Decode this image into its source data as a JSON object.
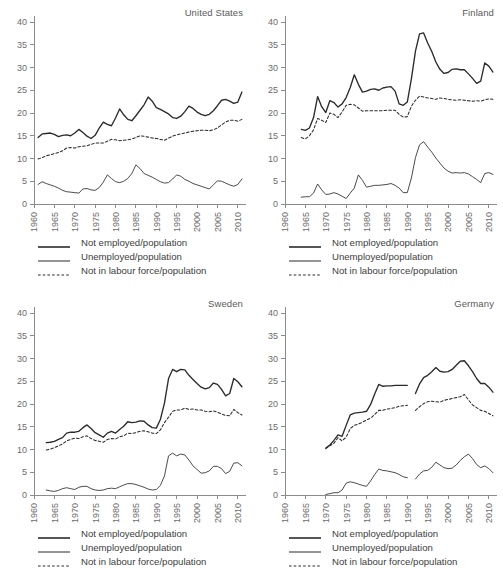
{
  "figure": {
    "width": 503,
    "height": 581,
    "background": "#ffffff",
    "line_color": "#2b2b2b",
    "axis_color": "#8c8c8c",
    "text_color": "#5a5a5a"
  },
  "legend": {
    "items": [
      {
        "label": "Not employed/population",
        "style": "solid",
        "width": "thick",
        "key": "legend-key-not-employed"
      },
      {
        "label": "Unemployed/population",
        "style": "solid",
        "width": "thin",
        "key": "legend-key-unemployed"
      },
      {
        "label": "Not in labour force/population",
        "style": "dashed",
        "width": "thin",
        "key": "legend-key-not-in-labour-force"
      }
    ]
  },
  "axes": {
    "x_ticks": [
      "1960",
      "1965",
      "1970",
      "1975",
      "1980",
      "1985",
      "1990",
      "1995",
      "2000",
      "2005",
      "2010"
    ],
    "x_tick_values": [
      1960,
      1965,
      1970,
      1975,
      1980,
      1985,
      1990,
      1995,
      2000,
      2005,
      2010
    ],
    "y_ticks": [
      "0",
      "5",
      "10",
      "15",
      "20",
      "25",
      "30",
      "35",
      "40"
    ],
    "y_tick_values": [
      0,
      5,
      10,
      15,
      20,
      25,
      30,
      35,
      40
    ],
    "xlim": [
      1960,
      2012
    ],
    "ylim": [
      0,
      40
    ],
    "grid": false,
    "xlabel": "",
    "ylabel": ""
  },
  "chart_data": [
    {
      "type": "line",
      "title": "United States",
      "panel": "top-left",
      "xlabel": "",
      "ylabel": "",
      "xlim": [
        1960,
        2012
      ],
      "ylim": [
        0,
        40
      ],
      "grid": false,
      "legend_position": "below",
      "x": [
        1961,
        1962,
        1963,
        1964,
        1965,
        1966,
        1967,
        1968,
        1969,
        1970,
        1971,
        1972,
        1973,
        1974,
        1975,
        1976,
        1977,
        1978,
        1979,
        1980,
        1981,
        1982,
        1983,
        1984,
        1985,
        1986,
        1987,
        1988,
        1989,
        1990,
        1991,
        1992,
        1993,
        1994,
        1995,
        1996,
        1997,
        1998,
        1999,
        2000,
        2001,
        2002,
        2003,
        2004,
        2005,
        2006,
        2007,
        2008,
        2009,
        2010,
        2011
      ],
      "series": [
        {
          "name": "Not employed/population",
          "style": "solid",
          "width": "thick",
          "values": [
            14.6,
            15.4,
            15.5,
            15.6,
            15.3,
            14.8,
            15.1,
            15.2,
            15.0,
            15.6,
            16.4,
            15.7,
            14.9,
            14.4,
            15.1,
            16.7,
            18.0,
            17.5,
            17.2,
            18.9,
            20.9,
            19.6,
            18.6,
            18.3,
            19.4,
            20.6,
            21.8,
            23.5,
            22.6,
            21.2,
            20.8,
            20.3,
            19.8,
            19.0,
            18.8,
            19.3,
            20.3,
            21.5,
            21.0,
            20.2,
            19.7,
            19.4,
            19.7,
            20.5,
            21.6,
            22.8,
            23.0,
            22.6,
            22.1,
            22.4,
            24.6,
            28.7,
            29.0
          ]
        },
        {
          "name": "Unemployed/population",
          "style": "solid",
          "width": "thin",
          "values": [
            4.3,
            4.9,
            4.5,
            4.2,
            3.9,
            3.5,
            3.0,
            2.7,
            2.6,
            2.5,
            2.4,
            3.3,
            3.4,
            3.1,
            3.0,
            3.6,
            4.8,
            6.4,
            5.6,
            4.9,
            4.7,
            5.0,
            5.6,
            6.7,
            8.6,
            7.8,
            6.7,
            6.3,
            5.9,
            5.4,
            4.9,
            4.6,
            4.7,
            5.5,
            6.4,
            6.1,
            5.4,
            5.0,
            4.5,
            4.2,
            3.9,
            3.6,
            3.3,
            4.2,
            5.1,
            5.0,
            4.6,
            4.2,
            3.9,
            4.3,
            5.5,
            8.4,
            7.5
          ]
        },
        {
          "name": "Not in labour force/population",
          "style": "dashed",
          "width": "thin",
          "values": [
            9.9,
            10.2,
            10.6,
            10.8,
            11.1,
            11.3,
            11.7,
            12.3,
            12.4,
            12.3,
            12.6,
            12.7,
            12.8,
            13.1,
            13.4,
            13.4,
            13.4,
            13.8,
            14.2,
            14.1,
            13.9,
            14.0,
            14.1,
            14.3,
            14.6,
            15.0,
            14.9,
            14.7,
            14.5,
            14.4,
            14.2,
            14.0,
            14.5,
            14.9,
            15.2,
            15.4,
            15.6,
            15.8,
            16.0,
            16.1,
            16.2,
            16.2,
            16.1,
            16.3,
            16.7,
            17.4,
            18.0,
            18.4,
            18.4,
            18.2,
            18.6,
            19.5,
            21.1
          ]
        }
      ]
    },
    {
      "type": "line",
      "title": "Finland",
      "panel": "top-right",
      "xlabel": "",
      "ylabel": "",
      "xlim": [
        1960,
        2012
      ],
      "ylim": [
        0,
        40
      ],
      "grid": false,
      "legend_position": "below",
      "x": [
        1964,
        1965,
        1966,
        1967,
        1968,
        1969,
        1970,
        1971,
        1972,
        1973,
        1974,
        1975,
        1976,
        1977,
        1978,
        1979,
        1980,
        1981,
        1982,
        1983,
        1984,
        1985,
        1986,
        1987,
        1988,
        1989,
        1990,
        1991,
        1992,
        1993,
        1994,
        1995,
        1996,
        1997,
        1998,
        1999,
        2000,
        2001,
        2002,
        2003,
        2004,
        2005,
        2006,
        2007,
        2008,
        2009,
        2010,
        2011
      ],
      "series": [
        {
          "name": "Not employed/population",
          "style": "solid",
          "width": "thick",
          "values": [
            16.4,
            16.2,
            16.7,
            19.0,
            23.6,
            21.4,
            20.1,
            22.7,
            22.3,
            21.3,
            22.0,
            23.4,
            25.6,
            28.4,
            26.3,
            24.6,
            24.8,
            25.2,
            25.3,
            25.0,
            25.5,
            25.7,
            25.8,
            24.8,
            22.0,
            21.7,
            22.4,
            27.5,
            33.6,
            37.4,
            37.6,
            35.4,
            33.5,
            31.2,
            29.6,
            28.7,
            28.9,
            29.6,
            29.7,
            29.5,
            29.5,
            28.6,
            27.6,
            26.5,
            27.0,
            31.0,
            30.3,
            29.0
          ]
        },
        {
          "name": "Unemployed/population",
          "style": "solid",
          "width": "thin",
          "values": [
            1.5,
            1.6,
            1.6,
            2.4,
            4.4,
            3.1,
            2.1,
            2.2,
            2.5,
            2.2,
            1.7,
            1.2,
            2.4,
            3.5,
            6.4,
            5.2,
            3.7,
            3.9,
            4.1,
            4.1,
            4.2,
            4.3,
            4.5,
            4.1,
            3.5,
            2.5,
            2.5,
            5.7,
            10.2,
            13.0,
            13.7,
            12.5,
            11.4,
            10.1,
            9.0,
            7.9,
            7.2,
            6.8,
            6.9,
            6.8,
            6.9,
            6.6,
            6.0,
            5.4,
            4.7,
            6.7,
            6.9,
            6.5
          ]
        },
        {
          "name": "Not in labour force/population",
          "style": "dashed",
          "width": "thin",
          "values": [
            14.6,
            14.3,
            15.0,
            16.3,
            18.8,
            18.4,
            17.9,
            20.0,
            19.7,
            19.0,
            20.2,
            21.7,
            21.9,
            21.8,
            21.1,
            20.4,
            20.5,
            20.5,
            20.5,
            20.5,
            20.5,
            20.6,
            20.6,
            20.6,
            19.7,
            19.1,
            19.2,
            21.5,
            22.8,
            23.7,
            23.5,
            23.3,
            23.2,
            23.0,
            23.3,
            23.2,
            23.0,
            22.9,
            22.8,
            22.9,
            22.8,
            22.7,
            22.6,
            22.7,
            22.6,
            22.9,
            23.1,
            23.0
          ]
        }
      ]
    },
    {
      "type": "line",
      "title": "Sweden",
      "panel": "bottom-left",
      "xlabel": "",
      "ylabel": "",
      "xlim": [
        1960,
        2012
      ],
      "ylim": [
        0,
        40
      ],
      "grid": false,
      "legend_position": "below",
      "x": [
        1963,
        1964,
        1965,
        1966,
        1967,
        1968,
        1969,
        1970,
        1971,
        1972,
        1973,
        1974,
        1975,
        1976,
        1977,
        1978,
        1979,
        1980,
        1981,
        1982,
        1983,
        1984,
        1985,
        1986,
        1987,
        1988,
        1989,
        1990,
        1991,
        1992,
        1993,
        1994,
        1995,
        1996,
        1997,
        1998,
        1999,
        2000,
        2001,
        2002,
        2003,
        2004,
        2005,
        2006,
        2007,
        2008,
        2009,
        2010,
        2011
      ],
      "series": [
        {
          "name": "Not employed/population",
          "style": "solid",
          "width": "thick",
          "values": [
            11.5,
            11.6,
            11.8,
            12.2,
            12.6,
            13.6,
            13.8,
            13.8,
            14.0,
            14.8,
            15.4,
            14.6,
            13.7,
            13.2,
            12.7,
            13.6,
            14.0,
            13.6,
            14.4,
            15.1,
            16.1,
            15.9,
            16.0,
            16.3,
            16.2,
            15.4,
            14.8,
            14.7,
            16.6,
            20.2,
            25.6,
            27.6,
            27.1,
            27.6,
            27.5,
            26.3,
            25.4,
            24.5,
            23.7,
            23.3,
            23.6,
            24.6,
            24.3,
            23.2,
            21.8,
            22.3,
            25.6,
            24.9,
            23.8
          ]
        },
        {
          "name": "Unemployed/population",
          "style": "solid",
          "width": "thin",
          "values": [
            1.1,
            0.9,
            0.8,
            1.0,
            1.4,
            1.6,
            1.4,
            1.2,
            1.7,
            1.9,
            1.9,
            1.4,
            1.1,
            1.0,
            1.1,
            1.4,
            1.5,
            1.4,
            1.8,
            2.2,
            2.5,
            2.5,
            2.3,
            2.0,
            1.7,
            1.3,
            1.1,
            1.2,
            2.1,
            4.2,
            8.6,
            9.2,
            8.6,
            9.0,
            8.8,
            7.7,
            6.4,
            5.6,
            4.8,
            4.9,
            5.3,
            6.3,
            6.3,
            5.8,
            4.7,
            5.2,
            7.0,
            7.1,
            6.4
          ]
        },
        {
          "name": "Not in labour force/population",
          "style": "dashed",
          "width": "thin",
          "values": [
            9.9,
            10.1,
            10.4,
            10.8,
            11.2,
            11.9,
            12.2,
            12.5,
            12.4,
            12.8,
            13.0,
            12.4,
            12.0,
            11.8,
            11.6,
            12.2,
            12.4,
            12.3,
            12.8,
            13.0,
            13.6,
            13.5,
            13.7,
            14.0,
            14.1,
            13.9,
            13.6,
            13.5,
            14.3,
            15.9,
            17.1,
            18.4,
            18.7,
            18.7,
            19.1,
            18.8,
            18.9,
            18.7,
            18.7,
            18.4,
            18.3,
            18.5,
            18.2,
            17.8,
            17.5,
            17.4,
            18.8,
            18.1,
            17.6
          ]
        }
      ]
    },
    {
      "type": "line",
      "title": "Germany",
      "panel": "bottom-right",
      "xlabel": "",
      "ylabel": "",
      "xlim": [
        1960,
        2012
      ],
      "ylim": [
        0,
        40
      ],
      "grid": false,
      "legend_position": "below",
      "note": "Break in series between 1990 and 1992 (reunification)",
      "x_segment_1": [
        1970,
        1971,
        1972,
        1973,
        1974,
        1975,
        1976,
        1977,
        1978,
        1979,
        1980,
        1981,
        1982,
        1983,
        1984,
        1985,
        1986,
        1987,
        1988,
        1989,
        1990
      ],
      "x_segment_2": [
        1992,
        1993,
        1994,
        1995,
        1996,
        1997,
        1998,
        1999,
        2000,
        2001,
        2002,
        2003,
        2004,
        2005,
        2006,
        2007,
        2008,
        2009,
        2010,
        2011
      ],
      "series": [
        {
          "name": "Not employed/population",
          "style": "solid",
          "width": "thick",
          "values_segment_1": [
            10.3,
            11.0,
            12.0,
            13.2,
            12.9,
            15.3,
            17.6,
            18.0,
            18.1,
            18.2,
            18.4,
            19.9,
            22.2,
            24.3,
            23.9,
            24.0,
            24.0,
            24.1,
            24.1,
            24.1,
            24.1
          ],
          "values_segment_2": [
            22.3,
            24.4,
            25.8,
            26.3,
            27.1,
            28.0,
            27.2,
            27.0,
            27.1,
            27.6,
            28.5,
            29.4,
            29.5,
            28.4,
            27.1,
            25.6,
            24.5,
            24.5,
            23.7,
            22.6
          ]
        },
        {
          "name": "Unemployed/population",
          "style": "solid",
          "width": "thin",
          "values_segment_1": [
            0.1,
            0.3,
            0.5,
            0.5,
            1.1,
            2.6,
            2.9,
            2.7,
            2.4,
            2.1,
            1.9,
            3.1,
            4.5,
            5.7,
            5.4,
            5.3,
            5.1,
            4.9,
            4.5,
            4.0,
            3.8
          ],
          "values_segment_2": [
            3.5,
            4.6,
            5.3,
            5.4,
            6.1,
            7.2,
            6.6,
            6.0,
            5.8,
            5.9,
            6.6,
            7.6,
            8.4,
            9.0,
            8.0,
            6.7,
            6.0,
            6.4,
            5.8,
            4.9
          ]
        },
        {
          "name": "Not in labour force/population",
          "style": "dashed",
          "width": "thin",
          "values_segment_1": [
            10.2,
            10.8,
            11.4,
            12.6,
            11.9,
            12.7,
            14.6,
            15.3,
            15.6,
            16.0,
            16.5,
            16.9,
            17.7,
            18.6,
            18.6,
            18.9,
            19.0,
            19.2,
            19.5,
            19.6,
            19.7
          ],
          "values_segment_2": [
            18.6,
            19.4,
            20.1,
            20.5,
            20.6,
            20.5,
            20.4,
            20.8,
            21.0,
            21.2,
            21.4,
            21.6,
            22.1,
            20.9,
            19.8,
            19.2,
            18.6,
            18.4,
            17.9,
            17.4
          ]
        }
      ]
    }
  ]
}
